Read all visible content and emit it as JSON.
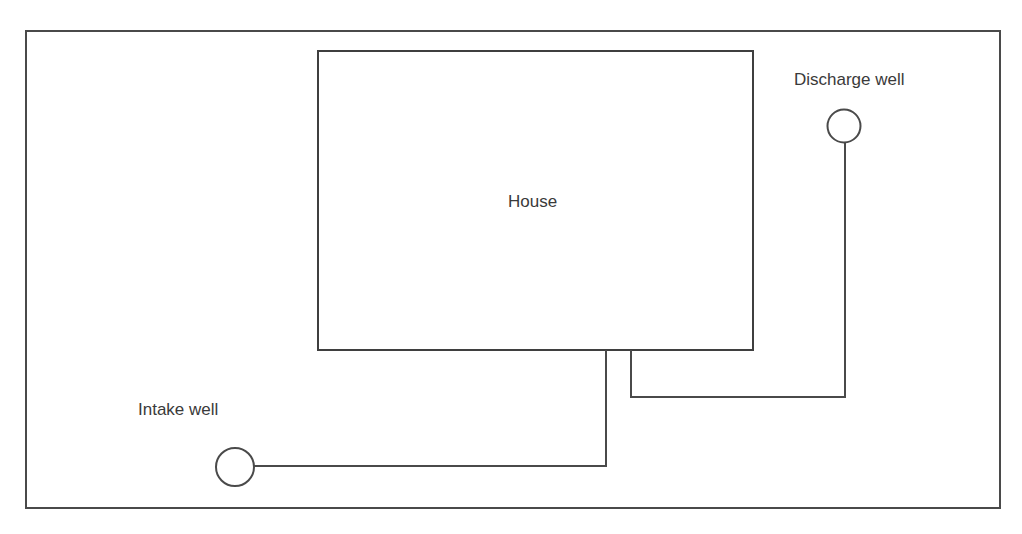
{
  "diagram": {
    "type": "site-plan",
    "colors": {
      "line": "#4a4a4a",
      "text": "#3a3a3a",
      "background": "#ffffff"
    },
    "nodes": [
      {
        "id": "house",
        "label": "House",
        "shape": "rectangle"
      },
      {
        "id": "discharge_well",
        "label": "Discharge well",
        "shape": "circle"
      },
      {
        "id": "intake_well",
        "label": "Intake well",
        "shape": "circle"
      }
    ],
    "edges": [
      {
        "from": "house",
        "to": "discharge_well",
        "kind": "pipe"
      },
      {
        "from": "house",
        "to": "intake_well",
        "kind": "pipe"
      }
    ]
  },
  "labels": {
    "house": "House",
    "discharge_well": "Discharge well",
    "intake_well": "Intake well"
  }
}
